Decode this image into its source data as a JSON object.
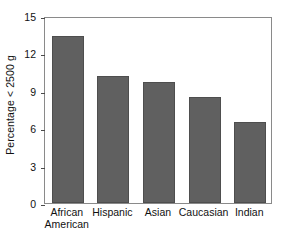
{
  "chart_data": {
    "type": "bar",
    "title": "",
    "subtitle": "",
    "xlabel": "",
    "ylabel": "Percentage < 2500 g",
    "categories": [
      "African American",
      "Hispanic",
      "Asian",
      "Caucasian",
      "Indian"
    ],
    "category_lines": [
      [
        "African",
        "American"
      ],
      [
        "Hispanic"
      ],
      [
        "Asian"
      ],
      [
        "Caucasian"
      ],
      [
        "Indian"
      ]
    ],
    "values": [
      13.4,
      10.2,
      9.7,
      8.5,
      6.5
    ],
    "ylim": [
      0,
      15
    ],
    "yticks": [
      0,
      3,
      6,
      9,
      12,
      15
    ],
    "ytick_labels": [
      "0",
      "3",
      "6",
      "9",
      "12",
      "15"
    ],
    "grid": false,
    "legend": "none",
    "bar_color": "#606060",
    "frame_color": "#8a8a8a",
    "axis_text_color": "#111111",
    "background": "#ffffff"
  }
}
